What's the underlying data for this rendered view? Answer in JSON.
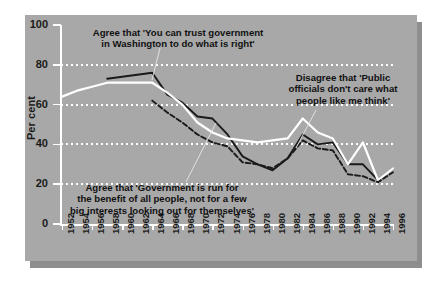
{
  "chart_data": {
    "type": "line",
    "title": "",
    "xlabel": "",
    "ylabel": "Per cent",
    "ylim": [
      0,
      100
    ],
    "yticks": [
      0,
      20,
      40,
      60,
      80,
      100
    ],
    "grid": "horizontal dotted white gridlines at 20, 40, 60, 80",
    "legend": "none (inline annotations with leader lines)",
    "background_color": "#a8a8a8",
    "categories": [
      "1952",
      "1954",
      "1956",
      "1958",
      "1960",
      "1962",
      "1964",
      "1966",
      "1968",
      "1970",
      "1972",
      "1974",
      "1976",
      "1978",
      "1980",
      "1982",
      "1984",
      "1986",
      "1988",
      "1990",
      "1992",
      "1994",
      "1996"
    ],
    "series": [
      {
        "name": "Agree that 'You can trust government in Washington to do what is right'",
        "style": "solid",
        "color": "#1a1a1a",
        "x": [
          "1958",
          "1960",
          "1962",
          "1964",
          "1966",
          "1968",
          "1970",
          "1972",
          "1974",
          "1976",
          "1978",
          "1980",
          "1982",
          "1984",
          "1986",
          "1988",
          "1990",
          "1992",
          "1994",
          "1996"
        ],
        "values": [
          73,
          74,
          75,
          76,
          65,
          61,
          54,
          53,
          45,
          34,
          30,
          27,
          33,
          45,
          40,
          41,
          30,
          30,
          22,
          28
        ]
      },
      {
        "name": "Agree that 'Government is run for the benefit of all people, not for a few big interests looking out for themselves'",
        "style": "solid",
        "color": "#ffffff",
        "x": [
          "1952",
          "1954",
          "1956",
          "1958",
          "1960",
          "1962",
          "1964",
          "1966",
          "1968",
          "1970",
          "1972",
          "1974",
          "1976",
          "1978",
          "1980",
          "1982",
          "1984",
          "1986",
          "1988",
          "1990",
          "1992",
          "1994",
          "1996"
        ],
        "values": [
          64,
          67,
          69,
          71,
          71,
          71,
          71,
          66,
          60,
          51,
          46,
          43,
          42,
          41,
          42,
          43,
          53,
          46,
          43,
          30,
          41,
          22,
          28
        ]
      },
      {
        "name": "Disagree that 'Public officials don't care what people like me think'",
        "style": "dashed",
        "color": "#1a1a1a",
        "x": [
          "1964",
          "1966",
          "1968",
          "1970",
          "1972",
          "1974",
          "1976",
          "1978",
          "1980",
          "1982",
          "1984",
          "1986",
          "1988",
          "1990",
          "1992",
          "1994",
          "1996"
        ],
        "values": [
          62,
          56,
          51,
          45,
          41,
          39,
          31,
          30,
          28,
          33,
          42,
          38,
          37,
          25,
          24,
          21,
          26
        ]
      }
    ],
    "annotations": [
      {
        "id": "trust",
        "text": "Agree that 'You can trust government\nin Washington to do what is right'",
        "points_to_series": "Agree that 'You can trust government in Washington to do what is right'"
      },
      {
        "id": "disagree",
        "text": "Disagree that 'Public\nofficials don't care what\npeople like me think'",
        "points_to_series": "Disagree that 'Public officials don't care what people like me think'"
      },
      {
        "id": "benefit",
        "text": "Agree that 'Government is run for\nthe benefit of all people, not for a few\nbig interests looking out for themselves'",
        "points_to_series": "Agree that 'Government is run for the benefit of all people, not for a few big interests looking out for themselves'"
      }
    ]
  }
}
